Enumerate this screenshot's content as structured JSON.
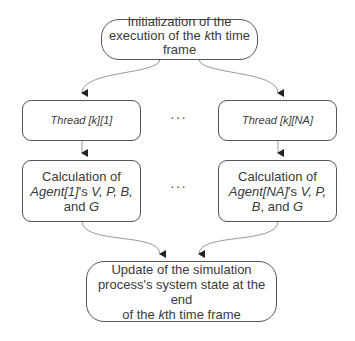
{
  "diagram": {
    "type": "flowchart",
    "nodes": {
      "init": {
        "line1": "Initialization of the",
        "line2_pre": "execution of the ",
        "line2_var": "k",
        "line2_post": "th time",
        "line3": "frame"
      },
      "thread_first": {
        "label": "Thread [k][1]"
      },
      "thread_last": {
        "label": "Thread [k][NA]"
      },
      "calc_first": {
        "line1": "Calculation of",
        "agent": "Agent[1]",
        "mid": "'s ",
        "vars_line2": "V, P, B,",
        "line3_pre": "and ",
        "line3_var": "G"
      },
      "calc_last": {
        "line1": "Calculation of",
        "agent": "Agent[NA]",
        "mid": "'s ",
        "vars_line2": "V, P,",
        "line3_var1": "B",
        "line3_mid": ", and ",
        "line3_var2": "G"
      },
      "update": {
        "line1": "Update of the simulation",
        "line2": "process's system state at the end",
        "line3_pre": "of the ",
        "line3_var": "k",
        "line3_post": "th time frame"
      }
    },
    "ellipsis": "···",
    "edges": [
      [
        "init",
        "thread_first"
      ],
      [
        "init",
        "thread_last"
      ],
      [
        "thread_first",
        "calc_first"
      ],
      [
        "thread_last",
        "calc_last"
      ],
      [
        "calc_first",
        "update"
      ],
      [
        "calc_last",
        "update"
      ]
    ]
  }
}
